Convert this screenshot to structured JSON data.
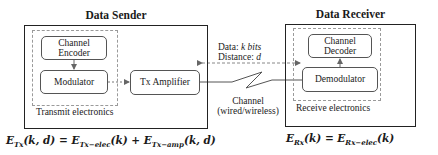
{
  "sender": {
    "title": "Data Sender",
    "channel_encoder": "Channel Encoder",
    "modulator": "Modulator",
    "tx_amplifier": "Tx Amplifier",
    "group_label": "Transmit electronics"
  },
  "receiver": {
    "title": "Data Receiver",
    "channel_decoder": "Channel Decoder",
    "demodulator": "Demodulator",
    "group_label": "Receive electronics"
  },
  "channel": {
    "data_label": "Data: ",
    "data_var": "k bits",
    "distance_label": "Distance: ",
    "distance_var": "d",
    "name": "Channel",
    "type": "(wired/wireless)"
  },
  "equations": {
    "tx": {
      "lhs": "E",
      "lhs_sub": "Tx",
      "lhs_args": "(k, d)",
      "eq": " = ",
      "t1": "E",
      "t1_sub": "Tx−elec",
      "t1_args": "(k)",
      "plus": " + ",
      "t2": "E",
      "t2_sub": "Tx−amp",
      "t2_args": "(k, d)"
    },
    "rx": {
      "lhs": "E",
      "lhs_sub": "Rx",
      "lhs_args": "(k)",
      "eq": " = ",
      "t1": "E",
      "t1_sub": "Rx−elec",
      "t1_args": "(k)"
    }
  }
}
